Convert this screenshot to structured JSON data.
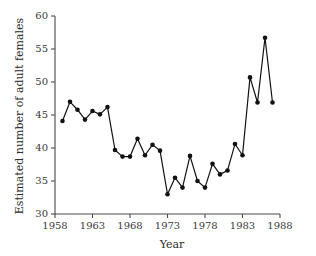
{
  "chart_data": {
    "type": "line",
    "title": "",
    "xlabel": "Year",
    "ylabel": "Estimated number of adult females",
    "xlim": [
      1958,
      1988
    ],
    "ylim": [
      30,
      60
    ],
    "xticks": [
      1958,
      1963,
      1968,
      1973,
      1978,
      1983,
      1988
    ],
    "xtick_labels": [
      "1958",
      "1963",
      "1968",
      "1973",
      "1978",
      "1983",
      "1988"
    ],
    "yticks": [
      30,
      35,
      40,
      45,
      50,
      55,
      60
    ],
    "ytick_labels": [
      "30",
      "35",
      "40",
      "45",
      "50",
      "55",
      "60"
    ],
    "grid": false,
    "legend": "none",
    "marker": "filled-circle",
    "line_color": "#111111",
    "marker_color": "#111111",
    "x": [
      1959,
      1960,
      1961,
      1962,
      1963,
      1964,
      1965,
      1966,
      1967,
      1968,
      1969,
      1970,
      1971,
      1972,
      1973,
      1974,
      1975,
      1976,
      1977,
      1978,
      1979,
      1980,
      1981,
      1982,
      1983,
      1984,
      1985,
      1986,
      1987
    ],
    "values": [
      44.1,
      47.0,
      45.8,
      44.3,
      45.6,
      45.1,
      46.2,
      39.7,
      38.7,
      38.7,
      41.4,
      38.9,
      40.5,
      39.6,
      33.0,
      35.5,
      34.0,
      38.8,
      35.0,
      34.0,
      37.6,
      36.0,
      36.6,
      40.6,
      38.9,
      50.7,
      46.9,
      56.7,
      46.9
    ],
    "series": [
      {
        "name": "Estimated number of adult females",
        "values": [
          44.1,
          47.0,
          45.8,
          44.3,
          45.6,
          45.1,
          46.2,
          39.7,
          38.7,
          38.7,
          41.4,
          38.9,
          40.5,
          39.6,
          33.0,
          35.5,
          34.0,
          38.8,
          35.0,
          34.0,
          37.6,
          36.0,
          36.6,
          40.6,
          38.9,
          50.7,
          46.9,
          56.7,
          46.9
        ]
      }
    ]
  }
}
